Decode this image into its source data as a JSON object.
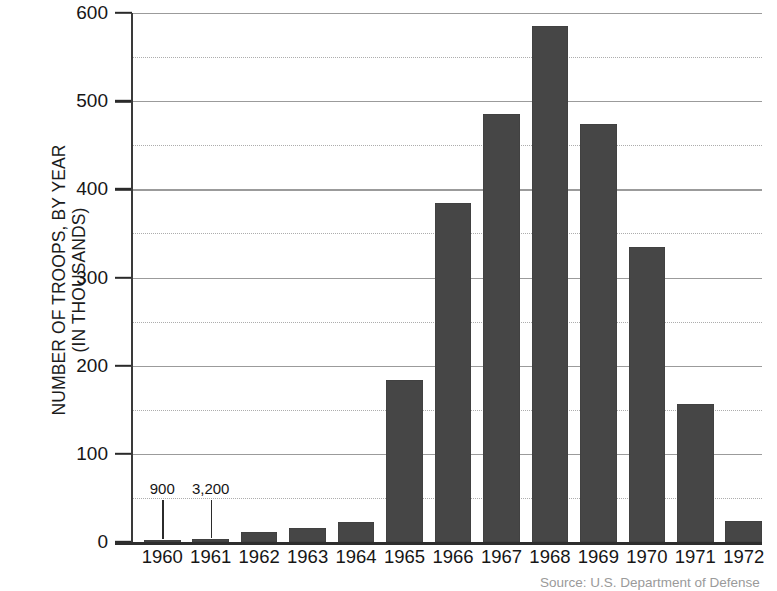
{
  "chart_data": {
    "type": "bar",
    "title": "",
    "xlabel": "",
    "ylabel": "NUMBER OF TROOPS, BY YEAR (IN THOUSANDS)",
    "ylabel_lines": [
      "NUMBER OF TROOPS, BY YEAR",
      "(IN THOUSANDS)"
    ],
    "categories": [
      "1960",
      "1961",
      "1962",
      "1963",
      "1964",
      "1965",
      "1966",
      "1967",
      "1968",
      "1969",
      "1970",
      "1971",
      "1972"
    ],
    "values": [
      0.9,
      3.2,
      11,
      16,
      23,
      184,
      385,
      485,
      585,
      474,
      335,
      156,
      24
    ],
    "ylim": [
      0,
      600
    ],
    "y_major_ticks": [
      0,
      100,
      200,
      300,
      400,
      500,
      600
    ],
    "y_minor_ticks": [
      50,
      150,
      250,
      350,
      450,
      550
    ],
    "y_tick_labels": [
      "0",
      "100",
      "200",
      "300",
      "400",
      "500",
      "600"
    ],
    "grid": "horizontal major solid, minor dotted",
    "legend": "none",
    "annotations": [
      {
        "category": "1960",
        "text": "900"
      },
      {
        "category": "1961",
        "text": "3,200"
      }
    ],
    "bar_color": "#464646",
    "gridline_major_color": "#9b9b9b",
    "gridline_minor_color": "#adadad",
    "axis_color": "#2e2e2e",
    "background_color": "#ffffff"
  },
  "source_note": "Source: U.S. Department of Defense"
}
